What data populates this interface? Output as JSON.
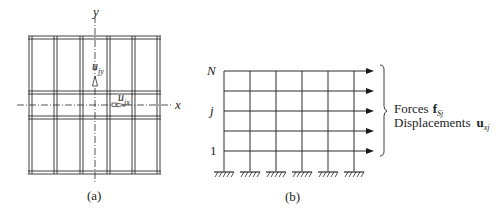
{
  "panel_a": {
    "caption": "(a)",
    "axis_x_label": "x",
    "axis_y_label": "y",
    "displacement_y": {
      "base": "u",
      "subscript": "jy"
    },
    "displacement_x": {
      "base": "u",
      "subscript": "jx"
    },
    "description": "Plan view of building floor with frame lines (5 bays in x, 3 bays in y) and centered x-y axes"
  },
  "panel_b": {
    "caption": "(b)",
    "level_labels": {
      "top": "N",
      "middle": "j",
      "bottom": "1"
    },
    "stories": 5,
    "bays": 5,
    "supports": 6,
    "annotation_forces_label": "Forces",
    "annotation_forces_symbol": {
      "base": "f",
      "subscript": "Sj"
    },
    "annotation_displacements_label": "Displacements",
    "annotation_displacements_symbol": {
      "base": "u",
      "subscript": "xj"
    },
    "description": "Plane frame elevation with lateral force arrows at each floor level, fixed supports at base"
  },
  "colors": {
    "line": "#2a2a2a",
    "background": "#ffffff"
  }
}
